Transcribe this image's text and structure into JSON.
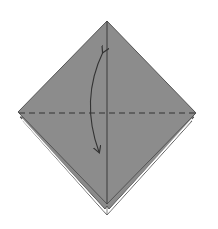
{
  "diagram": {
    "type": "origami-step",
    "colors": {
      "background": "#ffffff",
      "paper_front": "#8c8c8c",
      "paper_back_layer": "#8a8a8a",
      "paper_white_edge": "#ffffff",
      "outline": "#555555",
      "crease_line": "#3a3a3a",
      "fold_line_dashed": "#333333",
      "arrow": "#333333"
    },
    "elements": {
      "front_layer": {
        "top": [
          107,
          21
        ],
        "left": [
          18,
          112
        ],
        "right": [
          196,
          113
        ],
        "bottom": [
          107,
          204
        ]
      },
      "back_layer_1": {
        "left": [
          20,
          118
        ],
        "right": [
          194,
          118
        ],
        "bottom": [
          107,
          209
        ]
      },
      "back_layer_2": {
        "left": [
          23,
          121
        ],
        "right": [
          192,
          121
        ],
        "bottom": [
          107,
          215
        ]
      },
      "center_crease": {
        "from": [
          107,
          21
        ],
        "to": [
          107,
          204
        ]
      },
      "valley_fold_line": {
        "from": [
          18,
          113
        ],
        "to": [
          196,
          113
        ],
        "style": "dashed"
      },
      "arrow": {
        "start": [
          103,
          51
        ],
        "control": [
          82,
          105
        ],
        "end": [
          99,
          153
        ],
        "heads": "both"
      }
    }
  }
}
